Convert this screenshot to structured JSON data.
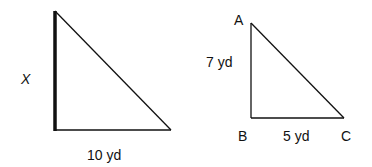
{
  "figure": {
    "left_triangle": {
      "unknown_side_label": "X",
      "base_label": "10 yd",
      "highlighted_side": "vertical leg"
    },
    "right_triangle": {
      "vertices": {
        "A": "A",
        "B": "B",
        "C": "C"
      },
      "side_ab_label": "7 yd",
      "side_bc_label": "5 yd"
    }
  },
  "colors": {
    "stroke": "#111111",
    "background": "#ffffff"
  }
}
